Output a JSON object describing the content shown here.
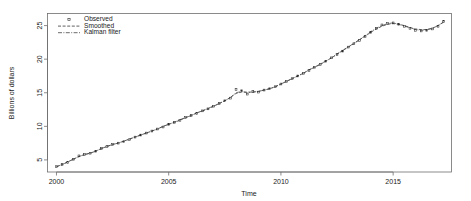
{
  "chart_data": {
    "type": "line",
    "title": "",
    "subtitle": "",
    "xlabel": "Time",
    "ylabel": "Billions of dollars",
    "xlim": [
      1999.6,
      2017.6
    ],
    "ylim": [
      3.2,
      26.8
    ],
    "xticks": [
      2000,
      2005,
      2010,
      2015
    ],
    "xticklabels": [
      "2000",
      "2005",
      "2010",
      "2015"
    ],
    "yticks": [
      5,
      10,
      15,
      20,
      25
    ],
    "yticklabels": [
      "5",
      "10",
      "15",
      "20",
      "25"
    ],
    "grid": false,
    "legend_position": "top-left",
    "legend": [
      {
        "label": "Observed",
        "marker": "point-square",
        "line": "none",
        "color": "#2b2b2b"
      },
      {
        "label": "Smoothed",
        "marker": "none",
        "line": "dashed",
        "color": "#2b2b2b"
      },
      {
        "label": "Kalman filter",
        "marker": "none",
        "line": "dash-dot",
        "color": "#2b2b2b"
      }
    ],
    "x": [
      2000.0,
      2000.25,
      2000.5,
      2000.75,
      2001.0,
      2001.25,
      2001.5,
      2001.75,
      2002.0,
      2002.25,
      2002.5,
      2002.75,
      2003.0,
      2003.25,
      2003.5,
      2003.75,
      2004.0,
      2004.25,
      2004.5,
      2004.75,
      2005.0,
      2005.25,
      2005.5,
      2005.75,
      2006.0,
      2006.25,
      2006.5,
      2006.75,
      2007.0,
      2007.25,
      2007.5,
      2007.75,
      2008.0,
      2008.25,
      2008.5,
      2008.75,
      2009.0,
      2009.25,
      2009.5,
      2009.75,
      2010.0,
      2010.25,
      2010.5,
      2010.75,
      2011.0,
      2011.25,
      2011.5,
      2011.75,
      2012.0,
      2012.25,
      2012.5,
      2012.75,
      2013.0,
      2013.25,
      2013.5,
      2013.75,
      2014.0,
      2014.25,
      2014.5,
      2014.75,
      2015.0,
      2015.25,
      2015.5,
      2015.75,
      2016.0,
      2016.25,
      2016.5,
      2016.75,
      2017.0,
      2017.25
    ],
    "series": [
      {
        "name": "Observed",
        "values": [
          4.0,
          4.3,
          4.6,
          5.1,
          5.6,
          5.8,
          6.0,
          6.3,
          6.7,
          7.0,
          7.3,
          7.5,
          7.7,
          8.0,
          8.4,
          8.7,
          9.0,
          9.3,
          9.6,
          9.9,
          10.3,
          10.6,
          10.9,
          11.3,
          11.6,
          11.9,
          12.3,
          12.6,
          13.0,
          13.4,
          13.8,
          14.2,
          15.5,
          15.3,
          14.8,
          15.2,
          15.1,
          15.4,
          15.6,
          15.9,
          16.3,
          16.7,
          17.1,
          17.5,
          17.9,
          18.3,
          18.8,
          19.2,
          19.7,
          20.2,
          20.7,
          21.2,
          21.8,
          22.3,
          22.8,
          23.4,
          24.0,
          24.6,
          25.1,
          25.3,
          25.4,
          25.2,
          24.9,
          24.6,
          24.3,
          24.2,
          24.3,
          24.5,
          24.9,
          25.6
        ]
      },
      {
        "name": "Smoothed",
        "values": [
          4.0,
          4.3,
          4.7,
          5.1,
          5.5,
          5.8,
          6.0,
          6.3,
          6.7,
          7.0,
          7.3,
          7.5,
          7.8,
          8.1,
          8.4,
          8.7,
          9.0,
          9.3,
          9.6,
          10.0,
          10.3,
          10.6,
          10.9,
          11.3,
          11.6,
          12.0,
          12.3,
          12.6,
          13.0,
          13.4,
          13.8,
          14.3,
          14.9,
          15.1,
          15.1,
          15.1,
          15.2,
          15.4,
          15.6,
          15.9,
          16.3,
          16.7,
          17.1,
          17.5,
          17.9,
          18.4,
          18.8,
          19.2,
          19.7,
          20.2,
          20.7,
          21.3,
          21.8,
          22.3,
          22.9,
          23.4,
          24.0,
          24.5,
          24.9,
          25.2,
          25.3,
          25.2,
          25.0,
          24.7,
          24.5,
          24.4,
          24.4,
          24.6,
          25.0,
          25.5
        ]
      },
      {
        "name": "Kalman filter",
        "values": [
          4.0,
          4.3,
          4.7,
          5.1,
          5.5,
          5.8,
          6.0,
          6.3,
          6.7,
          7.0,
          7.3,
          7.5,
          7.8,
          8.1,
          8.4,
          8.7,
          9.0,
          9.3,
          9.6,
          10.0,
          10.3,
          10.6,
          11.0,
          11.3,
          11.6,
          12.0,
          12.3,
          12.7,
          13.0,
          13.4,
          13.8,
          14.3,
          15.0,
          15.2,
          15.0,
          15.1,
          15.2,
          15.4,
          15.6,
          15.9,
          16.3,
          16.7,
          17.1,
          17.5,
          17.9,
          18.4,
          18.8,
          19.3,
          19.7,
          20.2,
          20.8,
          21.3,
          21.8,
          22.4,
          22.9,
          23.5,
          24.1,
          24.6,
          25.0,
          25.3,
          25.4,
          25.2,
          24.9,
          24.7,
          24.4,
          24.3,
          24.4,
          24.6,
          25.0,
          25.6
        ]
      }
    ]
  }
}
